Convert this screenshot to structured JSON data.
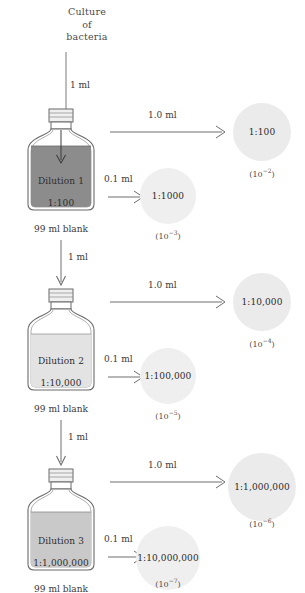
{
  "title_lines": [
    "Culture",
    "of",
    "bacteria"
  ],
  "colors": {
    "fill_dilution_1": "#8c8c8c",
    "fill_dilution_2": "#e3e3e3",
    "fill_dilution_3": "#c9c9c9",
    "glass_stroke": "#6b6b6b",
    "plate_fill": "#ebebeb",
    "arrow_stroke": "#6e6e6e",
    "text": "#2e2e2e"
  },
  "top_transfer": {
    "volume": "1 ml"
  },
  "stages": [
    {
      "bottle": {
        "name": "Dilution 1",
        "ratio": "1:100",
        "blank": "99 ml blank"
      },
      "inlet": {
        "volume": "1 ml"
      },
      "major": {
        "volume": "1.0 ml",
        "plate_label": "1:100",
        "exponent_base": "(10",
        "exponent_sup": "−2",
        "exponent_close": ")"
      },
      "minor": {
        "volume": "0.1 ml",
        "plate_label": "1:1000",
        "exponent_base": "(10",
        "exponent_sup": "−3",
        "exponent_close": ")"
      }
    },
    {
      "bottle": {
        "name": "Dilution 2",
        "ratio": "1:10,000",
        "blank": "99 ml blank"
      },
      "inlet": {
        "volume": "1 ml"
      },
      "major": {
        "volume": "1.0 ml",
        "plate_label": "1:10,000",
        "exponent_base": "(10",
        "exponent_sup": "−4",
        "exponent_close": ")"
      },
      "minor": {
        "volume": "0.1 ml",
        "plate_label": "1:100,000",
        "exponent_base": "(10",
        "exponent_sup": "−5",
        "exponent_close": ")"
      }
    },
    {
      "bottle": {
        "name": "Dilution 3",
        "ratio": "1:1,000,000",
        "blank": "99 ml blank"
      },
      "inlet": {
        "volume": "1 ml"
      },
      "major": {
        "volume": "1.0 ml",
        "plate_label": "1:1,000,000",
        "exponent_base": "(10",
        "exponent_sup": "−6",
        "exponent_close": ")"
      },
      "minor": {
        "volume": "0.1 ml",
        "plate_label": "1:10,000,000",
        "exponent_base": "(10",
        "exponent_sup": "−7",
        "exponent_close": ")"
      }
    }
  ]
}
